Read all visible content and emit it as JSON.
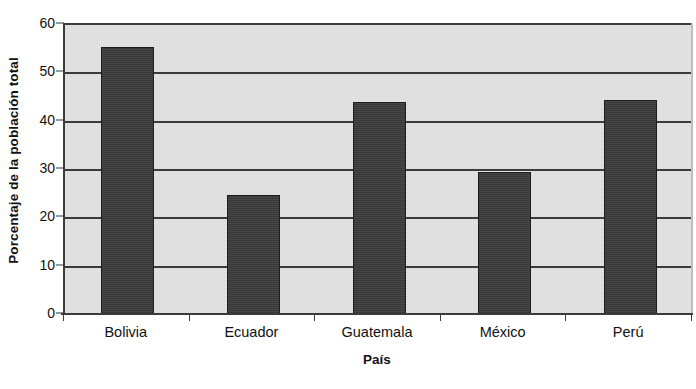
{
  "chart_data": {
    "type": "bar",
    "title": "",
    "xlabel": "País",
    "ylabel": "Porcentaje de la población total",
    "categories": [
      "Bolivia",
      "Ecuador",
      "Guatemala",
      "México",
      "Perú"
    ],
    "values": [
      55.5,
      24.8,
      44.0,
      29.5,
      44.5
    ],
    "ylim": [
      0,
      60
    ],
    "ytick_labels": [
      "60",
      "50",
      "40",
      "30",
      "20",
      "10",
      "0"
    ],
    "ytick_values": [
      60,
      50,
      40,
      30,
      20,
      10,
      0
    ],
    "grid": "horizontal",
    "legend": "none",
    "series": [
      {
        "name": "Porcentaje de la población total",
        "values": [
          55.5,
          24.8,
          44.0,
          29.5,
          44.5
        ]
      }
    ],
    "colors": {
      "bar_fill": "#3c3c3c",
      "bar_edge": "#1d1d1d",
      "plot_background": "#e3e3e3",
      "gridline": "#3b3b3b",
      "axis": "#3b3b3b",
      "text": "#111111",
      "page_background": "#ffffff"
    }
  }
}
